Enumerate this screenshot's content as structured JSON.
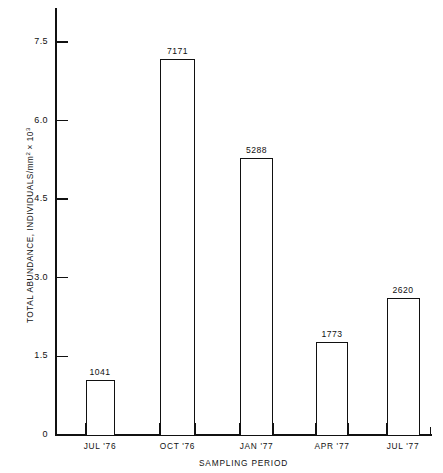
{
  "chart_data": {
    "type": "bar",
    "title": "",
    "subtitle": "",
    "xlabel": "SAMPLING PERIOD",
    "ylabel": "TOTAL ABUNDANCE, INDIVIDUALS/mm",
    "ylabel_exp_1": "2",
    "ylabel_mid": " × 10",
    "ylabel_exp_2": "3",
    "categories": [
      "JUL '76",
      "OCT '76",
      "JAN '77",
      "APR '77",
      "JUL '77"
    ],
    "values": [
      1041,
      7171,
      5288,
      1773,
      2620
    ],
    "value_labels": [
      "1041",
      "7171",
      "5288",
      "1773",
      "2620"
    ],
    "ylim": [
      0,
      7.5
    ],
    "yticks": [
      0,
      1.5,
      3.0,
      4.5,
      6.0,
      7.5
    ],
    "ytick_labels": [
      "0",
      "1.5",
      "3.0",
      "4.5",
      "6.0",
      "7.5"
    ],
    "units_scale": 1000,
    "grid": false,
    "legend": false,
    "bar_fill_color": "#ffffff",
    "bar_edge_color": "#111111",
    "axis_color": "#111111",
    "background_color": "#ffffff"
  }
}
